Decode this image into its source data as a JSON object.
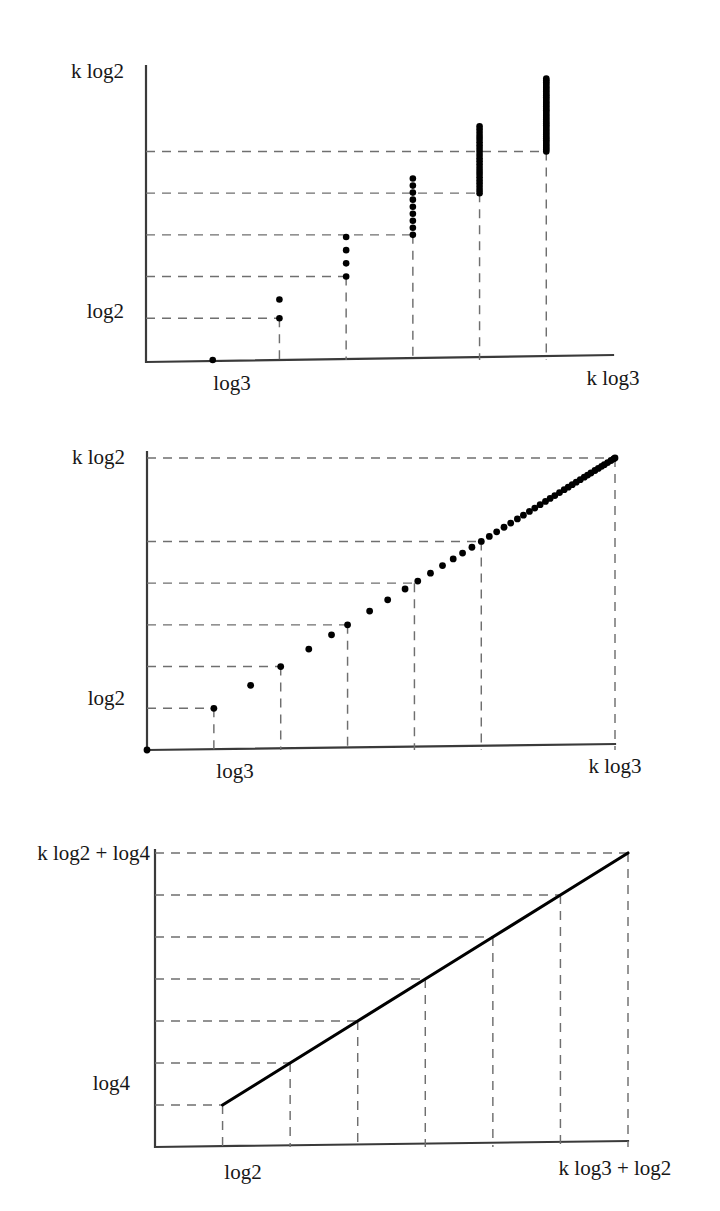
{
  "document": {
    "kind": "mathematical-figure-set",
    "panel_count": 3
  },
  "figures": [
    {
      "id": "figure-1",
      "name": "scatter-clusters",
      "y_axis": {
        "top_label": "k log2",
        "low_label": "log2"
      },
      "x_axis": {
        "first_label": "log3",
        "last_label": "k log3"
      }
    },
    {
      "id": "figure-2",
      "name": "monotone-point-sequence",
      "y_axis": {
        "top_label": "k log2",
        "low_label": "log2"
      },
      "x_axis": {
        "first_label": "log3",
        "last_label": "k log3"
      }
    },
    {
      "id": "figure-3",
      "name": "piecewise-linear-curve",
      "y_axis": {
        "top_label": "k log2 + log4",
        "low_label": "log4"
      },
      "x_axis": {
        "first_label": "log2",
        "last_label": "k log3 + log2"
      }
    }
  ],
  "chart_data": [
    {
      "type": "scatter",
      "title": "",
      "xlabel": "",
      "ylabel": "",
      "grid": true,
      "x_tick_labels": [
        "log3",
        "k log3"
      ],
      "y_tick_labels": [
        "k log2",
        "log2"
      ],
      "xlim": [
        0,
        7
      ],
      "ylim": [
        0,
        7
      ],
      "description": "Vertical columns of lattice points; column height and point count grow with x. Dashed guide lines connect each column top to the y-axis and each column base to the x-axis.",
      "columns": [
        {
          "x": 1,
          "count": 1,
          "y_bottom": 0.0,
          "y_top": 0.0
        },
        {
          "x": 2,
          "count": 2,
          "y_bottom": 1.0,
          "y_top": 1.45
        },
        {
          "x": 3,
          "count": 4,
          "y_bottom": 2.0,
          "y_top": 2.95
        },
        {
          "x": 4,
          "count": 9,
          "y_bottom": 3.0,
          "y_top": 4.35
        },
        {
          "x": 5,
          "count": 22,
          "y_bottom": 4.0,
          "y_top": 5.6
        },
        {
          "x": 6,
          "count": 40,
          "y_bottom": 5.0,
          "y_top": 6.75
        }
      ],
      "y_gridlines": [
        1.0,
        2.0,
        3.0,
        4.0,
        5.0
      ],
      "x_gridlines": [
        2,
        3,
        4,
        5,
        6
      ]
    },
    {
      "type": "scatter",
      "title": "",
      "xlabel": "",
      "ylabel": "",
      "grid": true,
      "x_tick_labels": [
        "log3",
        "k log3"
      ],
      "y_tick_labels": [
        "k log2",
        "log2"
      ],
      "xlim": [
        0,
        7
      ],
      "ylim": [
        0,
        7
      ],
      "description": "Increasing sequence of points rising from the origin to the upper-right corner; spacing contracts toward the right so points merge into a solid curve.",
      "points_x": [
        0.0,
        1.0,
        1.55,
        2.0,
        2.42,
        2.76,
        3.0,
        3.33,
        3.6,
        3.86,
        4.05,
        4.24,
        4.42,
        4.58,
        4.72,
        4.86,
        5.0,
        5.12,
        5.23,
        5.34,
        5.44,
        5.54,
        5.63,
        5.72,
        5.8,
        5.88,
        5.96,
        6.03,
        6.1,
        6.17,
        6.24,
        6.3,
        6.36,
        6.42,
        6.48,
        6.54,
        6.59,
        6.64,
        6.7,
        6.75,
        6.8,
        6.84,
        6.89,
        6.94,
        6.98,
        7.0
      ],
      "points_y": [
        0.0,
        1.0,
        1.55,
        2.0,
        2.42,
        2.76,
        3.0,
        3.33,
        3.6,
        3.86,
        4.05,
        4.24,
        4.42,
        4.58,
        4.72,
        4.86,
        5.0,
        5.12,
        5.23,
        5.34,
        5.44,
        5.54,
        5.63,
        5.72,
        5.8,
        5.88,
        5.96,
        6.03,
        6.1,
        6.17,
        6.24,
        6.3,
        6.36,
        6.42,
        6.48,
        6.54,
        6.59,
        6.64,
        6.7,
        6.75,
        6.8,
        6.84,
        6.89,
        6.94,
        6.98,
        7.0
      ],
      "y_gridlines": [
        1.0,
        2.0,
        3.0,
        4.0,
        5.0,
        7.0
      ],
      "x_gridlines": [
        1,
        2,
        3,
        4,
        5,
        6,
        7
      ]
    },
    {
      "type": "line",
      "title": "",
      "xlabel": "",
      "ylabel": "",
      "grid": true,
      "x_tick_labels": [
        "log2",
        "k log3 + log2"
      ],
      "y_tick_labels": [
        "k log2 + log4",
        "log4"
      ],
      "xlim": [
        0,
        7
      ],
      "ylim": [
        0,
        7
      ],
      "description": "Piecewise-linear increasing curve; each vertex lies on a horizontal dashed gridline and a vertical dashed gridline.",
      "vertices_x": [
        1.0,
        2.0,
        3.0,
        4.0,
        5.0,
        6.0,
        7.0
      ],
      "vertices_y": [
        1.0,
        2.0,
        3.0,
        4.0,
        5.0,
        6.0,
        7.0
      ],
      "y_gridlines": [
        1.0,
        2.0,
        3.0,
        4.0,
        5.0,
        6.0,
        7.0
      ],
      "x_gridlines": [
        1,
        2,
        3,
        4,
        5,
        6,
        7
      ]
    }
  ],
  "style": {
    "ink_color": "#000000",
    "axis_color": "#3a3a3a",
    "grid_color": "#6f6f6f",
    "background": "#ffffff"
  }
}
